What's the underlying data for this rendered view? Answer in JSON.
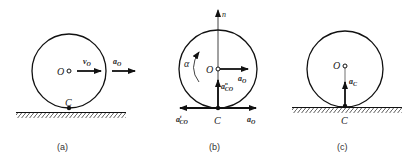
{
  "figures": [
    {
      "id": "a",
      "caption": "(a)",
      "labels": {
        "center": "O",
        "contact": "C",
        "velocity": "v",
        "velocity_sub": "O",
        "accel": "a",
        "accel_sub": "O"
      }
    },
    {
      "id": "b",
      "caption": "(b)",
      "labels": {
        "center": "O",
        "contact": "C",
        "axis": "n",
        "angular_accel": "α",
        "aO_center": "a",
        "aO_center_sub": "O",
        "aCO_n": "a",
        "aCO_n_sub": "CO",
        "aCO_n_sup": "n",
        "aCO_t": "a",
        "aCO_t_sub": "CO",
        "aCO_t_sup": "t",
        "aO_contact": "a",
        "aO_contact_sub": "O"
      }
    },
    {
      "id": "c",
      "caption": "(c)",
      "labels": {
        "center": "O",
        "contact": "C",
        "accel": "a",
        "accel_sub": "C"
      }
    }
  ],
  "colors": {
    "ink": "#111111"
  }
}
